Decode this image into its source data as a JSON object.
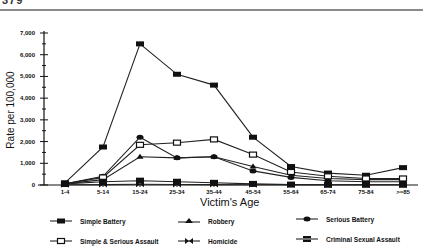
{
  "header": {
    "text": "379"
  },
  "chart_data": {
    "type": "line",
    "title": "",
    "xlabel": "Victim's Age",
    "ylabel": "Rate per 100,000",
    "ylim": [
      0,
      7000
    ],
    "yticks": [
      0,
      1000,
      2000,
      3000,
      4000,
      5000,
      6000,
      7000
    ],
    "ytick_labels": [
      "0",
      "1,000",
      "2,000",
      "3,000",
      "4,000",
      "5,000",
      "6,000",
      "7,000"
    ],
    "categories": [
      "1-4",
      "5-14",
      "15-24",
      "25-34",
      "35-44",
      "45-54",
      "55-64",
      "65-74",
      "75-84",
      ">=85"
    ],
    "grid": false,
    "legend_position": "bottom",
    "series": [
      {
        "name": "Simple Battery",
        "marker": "square",
        "values": [
          100,
          1750,
          6500,
          5100,
          4600,
          2200,
          850,
          550,
          450,
          800
        ]
      },
      {
        "name": "Robbery",
        "marker": "triangle",
        "values": [
          50,
          250,
          1300,
          1250,
          1300,
          850,
          450,
          300,
          250,
          250
        ]
      },
      {
        "name": "Serious Battery",
        "marker": "circle",
        "values": [
          50,
          400,
          2200,
          1250,
          1300,
          650,
          350,
          200,
          150,
          150
        ]
      },
      {
        "name": "Simple & Serious Assault",
        "marker": "square-open",
        "values": [
          50,
          350,
          1850,
          1950,
          2100,
          1400,
          600,
          400,
          300,
          300
        ]
      },
      {
        "name": "Homicide",
        "marker": "bowtie",
        "values": [
          10,
          20,
          30,
          25,
          20,
          15,
          10,
          10,
          10,
          10
        ]
      },
      {
        "name": "Criminal Sexual Assault",
        "marker": "square-x",
        "values": [
          50,
          150,
          200,
          150,
          100,
          50,
          20,
          10,
          10,
          10
        ]
      }
    ]
  },
  "legend": {
    "items": [
      {
        "label": "Simple Battery"
      },
      {
        "label": "Robbery"
      },
      {
        "label": "Serious Battery"
      },
      {
        "label": "Simple & Serious Assault"
      },
      {
        "label": "Homicide"
      },
      {
        "label": "Criminal Sexual Assault"
      }
    ]
  }
}
